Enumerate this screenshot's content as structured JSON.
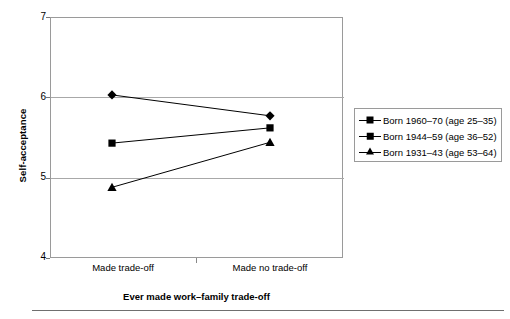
{
  "chart_data": {
    "type": "line",
    "title": "",
    "xlabel": "Ever made work–family trade-off",
    "ylabel": "Self-acceptance",
    "categories": [
      "Made trade-off",
      "Made no trade-off"
    ],
    "ylim": [
      4,
      7
    ],
    "yticks": [
      4,
      5,
      6,
      7
    ],
    "ytick_labels": [
      "4",
      "5",
      "6",
      "7"
    ],
    "grid": true,
    "grid_axis": "y",
    "legend_position": "right",
    "series": [
      {
        "name": "Born 1960–70 (age 25–35)",
        "marker": "diamond",
        "color": "#000000",
        "values": [
          6.03,
          5.77
        ]
      },
      {
        "name": "Born 1944–59 (age 36–52)",
        "marker": "square",
        "color": "#000000",
        "values": [
          5.43,
          5.62
        ]
      },
      {
        "name": "Born 1931–43 (age 53–64)",
        "marker": "triangle",
        "color": "#000000",
        "values": [
          4.88,
          5.44
        ]
      }
    ]
  },
  "axes": {
    "y_title": "Self-acceptance",
    "x_title": "Ever made work–family trade-off",
    "y_tick_7": "7",
    "y_tick_6": "6",
    "y_tick_5": "5",
    "y_tick_4": "4",
    "x_tick_1": "Made trade-off",
    "x_tick_2": "Made no trade-off"
  },
  "legend": {
    "items": [
      {
        "label": "Born 1960–70 (age 25–35)",
        "marker": "diamond-marker"
      },
      {
        "label": "Born 1944–59 (age 36–52)",
        "marker": "square-marker"
      },
      {
        "label": "Born 1931–43 (age 53–64)",
        "marker": "triangle-marker"
      }
    ]
  }
}
